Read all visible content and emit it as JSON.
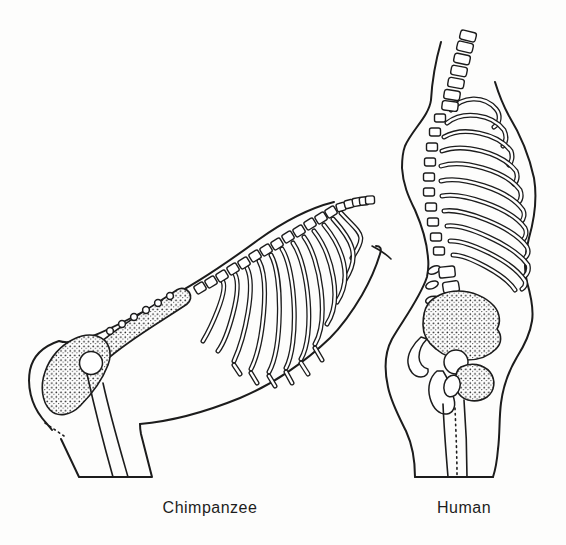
{
  "canvas": {
    "background": "#fdfdfc",
    "ink": "#1c1c1c",
    "width": 566,
    "height": 545
  },
  "figures": [
    {
      "id": "chimpanzee",
      "label": "Chimpanzee"
    },
    {
      "id": "human",
      "label": "Human"
    }
  ]
}
